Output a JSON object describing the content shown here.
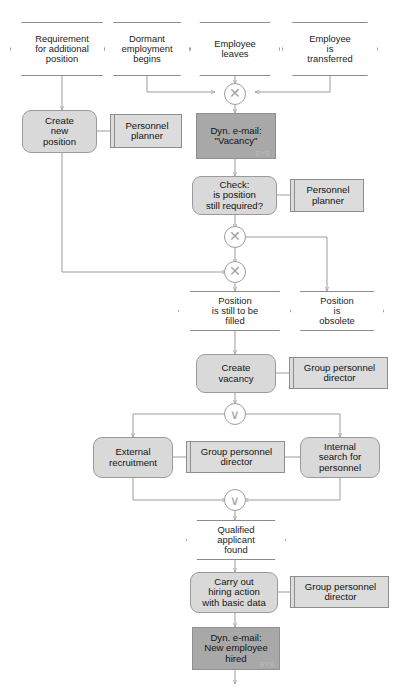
{
  "diagram": {
    "type": "event-driven-process-chain",
    "colors": {
      "event_fill": "#ffffff",
      "function_fill": "#d9d9d9",
      "system_fill": "#a8a8a8",
      "orgunit_fill": "#dcdcdc",
      "line": "#9d9d9d",
      "text": "#1a1a1a"
    }
  },
  "events": [
    {
      "id": "evt-requirement-additional-position",
      "label": "Requirement\nfor additional\nposition"
    },
    {
      "id": "evt-dormant-employment-begins",
      "label": "Dormant\nemployment\nbegins"
    },
    {
      "id": "evt-employee-leaves",
      "label": "Employee\nleaves"
    },
    {
      "id": "evt-employee-transferred",
      "label": "Employee\nis\ntransferred"
    },
    {
      "id": "evt-position-still-to-be-filled",
      "label": "Position\nis still to be\nfilled"
    },
    {
      "id": "evt-position-obsolete",
      "label": "Position\nis\nobsolete"
    },
    {
      "id": "evt-qualified-applicant-found",
      "label": "Qualified\napplicant\nfound"
    }
  ],
  "functions": [
    {
      "id": "fn-create-new-position",
      "label": "Create\nnew\nposition"
    },
    {
      "id": "fn-check-position",
      "label": "Check:\nis position\nstill required?"
    },
    {
      "id": "fn-create-vacancy",
      "label": "Create\nvacancy"
    },
    {
      "id": "fn-external-recruitment",
      "label": "External\nrecruitment"
    },
    {
      "id": "fn-internal-search",
      "label": "Internal\nsearch for\npersonnel"
    },
    {
      "id": "fn-carry-out-hiring",
      "label": "Carry out\nhiring action\nwith basic data"
    }
  ],
  "systems": [
    {
      "id": "sys-dyn-email-vacancy",
      "label": "Dyn. e-mail:\n\"Vacancy\"",
      "tag": "SYS"
    },
    {
      "id": "sys-dyn-email-new-employee",
      "label": "Dyn. e-mail:\nNew employee\nhired",
      "tag": "SYS"
    }
  ],
  "orgunits": [
    {
      "id": "org-personnel-planner-1",
      "label": "Personnel\nplanner"
    },
    {
      "id": "org-personnel-planner-2",
      "label": "Personnel\nplanner"
    },
    {
      "id": "org-group-personnel-director-1",
      "label": "Group personnel\ndirector"
    },
    {
      "id": "org-group-personnel-director-2",
      "label": "Group personnel\ndirector"
    },
    {
      "id": "org-group-personnel-director-3",
      "label": "Group personnel\ndirector"
    }
  ],
  "connectors": [
    {
      "id": "conn-xor-1",
      "operator": "XOR",
      "symbol": "✕"
    },
    {
      "id": "conn-xor-2",
      "operator": "XOR",
      "symbol": "✕"
    },
    {
      "id": "conn-xor-3",
      "operator": "XOR",
      "symbol": "✕"
    },
    {
      "id": "conn-or-split",
      "operator": "OR",
      "symbol": "∨"
    },
    {
      "id": "conn-or-join",
      "operator": "OR",
      "symbol": "∨"
    }
  ]
}
